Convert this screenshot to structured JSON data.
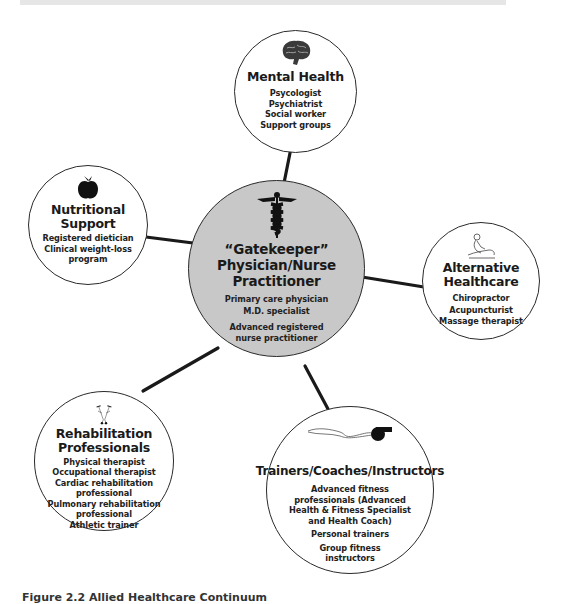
{
  "figure": {
    "caption": "Figure 2.2 Allied Healthcare Continuum"
  },
  "nodes": {
    "center": {
      "icon": "caduceus-icon",
      "title_lines": [
        "“Gatekeeper”",
        "Physician/Nurse",
        "Practitioner"
      ],
      "items": [
        "Primary care physician",
        "M.D. specialist"
      ],
      "items_group2": [
        "Advanced registered",
        "nurse practitioner"
      ],
      "fill_color": "#c8c8c8"
    },
    "mental_health": {
      "icon": "brain-icon",
      "title_lines": [
        "Mental Health"
      ],
      "items": [
        "Psycologist",
        "Psychiatrist",
        "Social worker",
        "Support groups"
      ]
    },
    "nutritional_support": {
      "icon": "apple-icon",
      "title_lines": [
        "Nutritional",
        "Support"
      ],
      "items": [
        "Registered dietician",
        "Clinical weight-loss",
        "program"
      ]
    },
    "alternative_healthcare": {
      "icon": "massage-icon",
      "title_lines": [
        "Alternative",
        "Healthcare"
      ],
      "items": [
        "Chiropractor",
        "Acupuncturist",
        "Massage therapist"
      ]
    },
    "rehabilitation": {
      "icon": "crutches-icon",
      "title_lines": [
        "Rehabilitation",
        "Professionals"
      ],
      "items": [
        "Physical therapist",
        "Occupational therapist",
        "Cardiac rehabilitation",
        "professional",
        "Pulmonary rehabilitation",
        "professional",
        "Athletic trainer"
      ]
    },
    "trainers": {
      "icon": "whistle-icon",
      "title_lines": [
        "Trainers/Coaches/Instructors"
      ],
      "items": [
        "Advanced fitness",
        "professionals (Advanced",
        "Health & Fitness Specialist",
        "and Health Coach)"
      ],
      "items_group2": [
        "Personal trainers"
      ],
      "items_group3": [
        "Group fitness",
        "instructors"
      ]
    }
  },
  "connectors": [
    {
      "from": "center",
      "to": "mental_health"
    },
    {
      "from": "center",
      "to": "nutritional_support"
    },
    {
      "from": "center",
      "to": "alternative_healthcare"
    },
    {
      "from": "center",
      "to": "rehabilitation"
    },
    {
      "from": "center",
      "to": "trainers"
    }
  ]
}
